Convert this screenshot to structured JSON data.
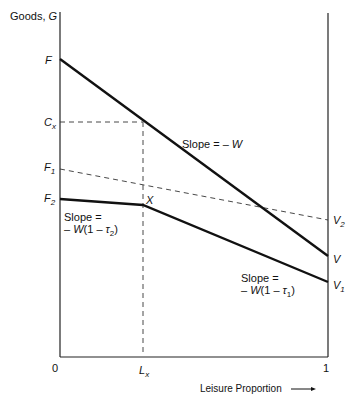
{
  "diagram": {
    "y_axis_label": "Goods, ",
    "y_axis_var": "G",
    "x_axis_label": "Leisure Proportion",
    "x_axis_arrow": "→",
    "x_ticks": {
      "zero": "0",
      "lx": "L",
      "lx_sub": "x",
      "one": "1"
    },
    "left_labels": {
      "F": "F",
      "Cx": "C",
      "Cx_sub": "x",
      "F1": "F",
      "F1_sub": "1",
      "F2": "F",
      "F2_sub": "2"
    },
    "right_labels": {
      "V2": "V",
      "V2_sub": "2",
      "V": "V",
      "V1": "V",
      "V1_sub": "1"
    },
    "point_label": "X",
    "annotations": {
      "slope_w": "Slope = – ",
      "slope_w_var": "W",
      "slope_t2_line1": "Slope =",
      "slope_t2_line2_pre": "– ",
      "slope_t2_var": "W",
      "slope_t2_paren": "(1 – ",
      "slope_t2_tau": "τ",
      "slope_t2_tau_sub": "2",
      "slope_t2_close": ")",
      "slope_t1_line1": "Slope =",
      "slope_t1_line2_pre": "– ",
      "slope_t1_var": "W",
      "slope_t1_paren": "(1 – ",
      "slope_t1_tau": "τ",
      "slope_t1_tau_sub": "1",
      "slope_t1_close": ")"
    },
    "colors": {
      "line": "#111111",
      "dashed": "#333333"
    }
  }
}
